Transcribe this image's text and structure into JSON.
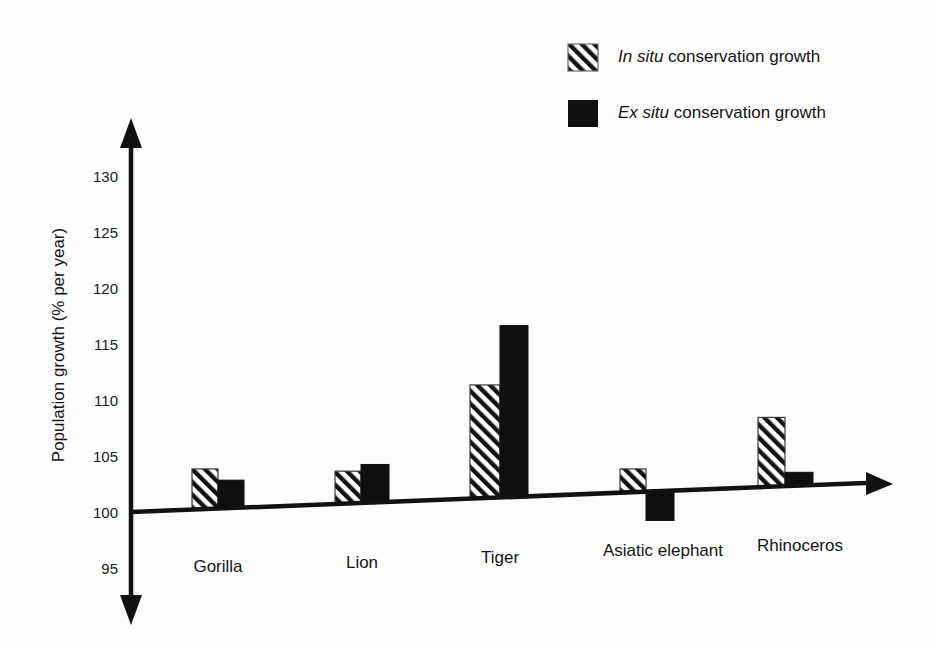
{
  "chart_data": {
    "type": "bar",
    "title": "",
    "xlabel": "",
    "ylabel": "Population growth (% per year)",
    "categories": [
      "Gorilla",
      "Lion",
      "Tiger",
      "Asiatic elephant",
      "Rhinoceros"
    ],
    "series": [
      {
        "name": "In situ conservation growth",
        "name_italic_prefix": "In situ",
        "name_rest": " conservation growth",
        "style": "hatched",
        "values": [
          103.8,
          103.6,
          111.3,
          103.8,
          108.4
        ]
      },
      {
        "name": "Ex situ conservation growth",
        "name_italic_prefix": "Ex situ",
        "name_rest": " conservation growth",
        "style": "solid",
        "values": [
          102.8,
          104.2,
          116.6,
          99.2,
          103.5
        ]
      }
    ],
    "ylim": [
      95,
      130
    ],
    "yticks": [
      95,
      100,
      105,
      110,
      115,
      120,
      125,
      130
    ],
    "ytick_labels": [
      "95",
      "100",
      "105",
      "110",
      "115",
      "120",
      "125",
      "130"
    ],
    "baseline_value": 100,
    "grid": false,
    "legend_position": "top-right",
    "axis_style": "double-headed-arrow",
    "colors": {
      "solid_bar": "#100f0f",
      "hatch_stroke": "#3a3a3a",
      "axis": "#111111",
      "text": "#141414",
      "background": "#fdfdfd"
    }
  },
  "legend": {
    "items": [
      {
        "swatch": "hatched-swatch",
        "italic": "In situ",
        "rest": " conservation growth"
      },
      {
        "swatch": "solid-swatch",
        "italic": "Ex situ",
        "rest": " conservation growth"
      }
    ]
  },
  "axes": {
    "y_title": "Population growth (% per year)"
  }
}
